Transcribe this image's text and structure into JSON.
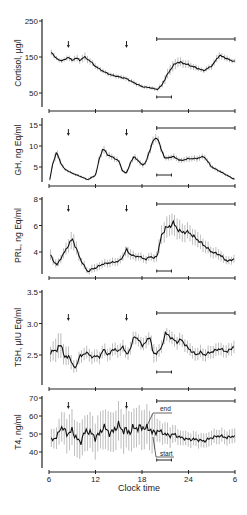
{
  "figure": {
    "xlabel": "Clock time",
    "x_ticks": [
      6,
      12,
      18,
      24,
      30
    ],
    "x_tick_labels": [
      "6",
      "12",
      "18",
      "24",
      "6"
    ]
  },
  "chart_data": [
    {
      "type": "line",
      "title": "",
      "ylabel": "Cortisol, µg/l",
      "y_ticks": [
        50,
        150,
        250
      ],
      "ylim": [
        30,
        250
      ],
      "xlim": [
        6,
        30
      ],
      "x": [
        6.3,
        7,
        7.5,
        8,
        8.5,
        9,
        9.5,
        10,
        10.5,
        11,
        11.5,
        12,
        13,
        14,
        15,
        16,
        17,
        18,
        18.5,
        19,
        19.5,
        20,
        20.5,
        21,
        21.5,
        22,
        22.5,
        23,
        24,
        25,
        26,
        27,
        27.5,
        28,
        28.5,
        29,
        29.5,
        30
      ],
      "values": [
        163,
        145,
        140,
        142,
        150,
        140,
        148,
        140,
        150,
        144,
        135,
        124,
        110,
        100,
        95,
        90,
        78,
        68,
        66,
        65,
        62,
        60,
        70,
        90,
        110,
        125,
        135,
        135,
        128,
        120,
        112,
        125,
        140,
        155,
        150,
        145,
        140,
        138
      ],
      "error": [
        8,
        6,
        6,
        6,
        8,
        6,
        10,
        8,
        12,
        10,
        8,
        8,
        6,
        6,
        6,
        6,
        6,
        5,
        5,
        5,
        5,
        5,
        8,
        12,
        14,
        14,
        14,
        12,
        10,
        8,
        6,
        8,
        10,
        10,
        8,
        8,
        6,
        6
      ],
      "arrows_x": [
        8.5,
        16
      ],
      "sleep_bar": [
        19.9,
        30
      ],
      "short_bar": [
        19.9,
        21.8
      ]
    },
    {
      "type": "line",
      "ylabel": "GH, ng Eq/ml",
      "y_ticks": [
        5,
        10,
        15
      ],
      "ylim": [
        0,
        16
      ],
      "xlim": [
        6,
        30
      ],
      "x": [
        6.1,
        6.5,
        7,
        7.5,
        8,
        8.5,
        9,
        10,
        11,
        12,
        12.5,
        13,
        13.5,
        14,
        15,
        15.5,
        16,
        16.5,
        17,
        17.5,
        18,
        18.5,
        19,
        19.5,
        20,
        20.5,
        21,
        22,
        23,
        24,
        25,
        26,
        27,
        28,
        29,
        30
      ],
      "values": [
        2,
        6,
        8.5,
        6,
        4.5,
        4,
        3.5,
        2.8,
        2,
        3,
        7,
        9.5,
        8,
        7.5,
        6.5,
        4,
        3.5,
        6,
        7.5,
        6.5,
        5.5,
        6,
        9,
        11.5,
        12,
        9,
        7,
        7.5,
        6.5,
        7,
        7,
        7.5,
        5,
        4,
        3,
        2
      ],
      "error": [
        0.3,
        0.8,
        1,
        0.6,
        0.4,
        0.3,
        0.3,
        0.3,
        0.3,
        0.4,
        0.8,
        1,
        0.8,
        0.8,
        0.6,
        0.4,
        0.4,
        0.6,
        0.8,
        0.6,
        0.6,
        0.7,
        1,
        1,
        1,
        0.8,
        0.6,
        0.7,
        0.6,
        0.7,
        0.7,
        0.7,
        0.5,
        0.4,
        0.3,
        0.3
      ],
      "arrows_x": [
        8.5,
        16
      ],
      "sleep_bar": [
        19.9,
        30
      ],
      "short_bar": [
        19.9,
        21.8
      ]
    },
    {
      "type": "line",
      "ylabel": "PRL, ng Eq/ml",
      "y_ticks": [
        4,
        6,
        8
      ],
      "ylim": [
        2,
        8
      ],
      "xlim": [
        6,
        30
      ],
      "x": [
        6.2,
        6.5,
        7,
        7.5,
        8,
        8.5,
        9,
        9.5,
        10,
        10.5,
        11,
        11.5,
        12,
        13,
        14,
        15,
        15.5,
        16,
        16.5,
        17,
        18,
        18.5,
        19,
        19.5,
        20,
        20.5,
        21,
        21.5,
        22,
        22.5,
        23,
        24,
        25,
        26,
        27,
        28,
        29,
        30
      ],
      "values": [
        3.8,
        3.4,
        3,
        3.5,
        4,
        4.5,
        5,
        4.3,
        3.5,
        3,
        2.5,
        2.7,
        2.8,
        3.1,
        3.2,
        3.3,
        3.6,
        4.2,
        3.8,
        3.7,
        3.6,
        3.4,
        3.7,
        3.5,
        3.8,
        5.2,
        5.8,
        5.9,
        6.2,
        5.8,
        5.5,
        5.5,
        5,
        4.5,
        4,
        3.8,
        3.3,
        3.5
      ],
      "error": [
        0.4,
        0.3,
        0.3,
        0.3,
        0.4,
        0.5,
        0.7,
        0.5,
        0.3,
        0.3,
        0.2,
        0.3,
        0.3,
        0.3,
        0.3,
        0.3,
        0.3,
        0.4,
        0.4,
        0.3,
        0.3,
        0.3,
        0.3,
        0.3,
        0.4,
        0.7,
        0.8,
        0.8,
        0.8,
        0.8,
        0.7,
        0.6,
        0.6,
        0.5,
        0.4,
        0.4,
        0.3,
        0.3
      ],
      "arrows_x": [
        8.5,
        16
      ],
      "sleep_bar": [
        19.9,
        30
      ],
      "short_bar": [
        19.9,
        21.8
      ]
    },
    {
      "type": "line",
      "ylabel": "TSH, µIU Eq/ml",
      "y_ticks": [
        2.5,
        3.0,
        3.5
      ],
      "ylim": [
        2.08,
        3.5
      ],
      "xlim": [
        6,
        30
      ],
      "x": [
        6.2,
        6.5,
        7,
        7.5,
        8,
        8.5,
        9,
        9.5,
        10,
        10.5,
        11,
        11.5,
        12,
        12.5,
        13,
        13.5,
        14,
        14.5,
        15,
        15.5,
        16,
        16.5,
        17,
        17.5,
        18,
        18.5,
        19,
        19.5,
        20,
        20.5,
        21,
        22,
        22.5,
        23,
        24,
        25,
        25.5,
        26,
        27,
        28,
        29,
        30
      ],
      "values": [
        2.5,
        2.6,
        2.55,
        2.7,
        2.45,
        2.5,
        2.35,
        2.3,
        2.5,
        2.5,
        2.55,
        2.45,
        2.5,
        2.45,
        2.6,
        2.5,
        2.55,
        2.6,
        2.55,
        2.65,
        2.5,
        2.6,
        2.8,
        2.75,
        2.65,
        2.7,
        2.8,
        2.5,
        2.55,
        2.6,
        2.85,
        2.75,
        2.7,
        2.75,
        2.6,
        2.5,
        2.55,
        2.5,
        2.55,
        2.6,
        2.55,
        2.65
      ],
      "error": [
        0.12,
        0.15,
        0.2,
        0.2,
        0.15,
        0.15,
        0.1,
        0.1,
        0.1,
        0.1,
        0.1,
        0.1,
        0.1,
        0.1,
        0.1,
        0.1,
        0.1,
        0.1,
        0.1,
        0.1,
        0.1,
        0.1,
        0.1,
        0.1,
        0.1,
        0.1,
        0.1,
        0.15,
        0.1,
        0.1,
        0.1,
        0.1,
        0.1,
        0.1,
        0.1,
        0.1,
        0.1,
        0.1,
        0.1,
        0.1,
        0.1,
        0.1
      ],
      "arrows_x": [
        8.5,
        16
      ],
      "sleep_bar": [
        19.9,
        30
      ],
      "short_bar": [
        19.9,
        21.8
      ]
    },
    {
      "type": "line",
      "ylabel": "T4, ng/ml",
      "y_ticks": [
        40,
        50,
        60,
        70
      ],
      "ylim": [
        30,
        70
      ],
      "xlim": [
        6,
        30
      ],
      "x": [
        6.3,
        7,
        7.5,
        8,
        8.5,
        9,
        9.5,
        10,
        10.5,
        11,
        11.5,
        12,
        12.5,
        13,
        13.5,
        14,
        14.5,
        15,
        15.5,
        16,
        16.5,
        17,
        17.5,
        18,
        18.5,
        19,
        19.5,
        20,
        20.5,
        21,
        21.5,
        22,
        23,
        24,
        25,
        26,
        27,
        28,
        29,
        30
      ],
      "values": [
        47,
        48,
        54,
        52,
        50,
        52,
        48,
        45,
        50,
        52,
        50,
        48,
        50,
        54,
        52,
        50,
        53,
        55,
        52,
        52,
        51,
        54,
        53,
        54,
        53,
        53,
        50,
        52,
        51,
        50,
        49,
        50,
        48,
        47,
        47,
        46,
        48,
        49,
        48,
        49
      ],
      "error": [
        5,
        6,
        8,
        9,
        10,
        10,
        10,
        10,
        10,
        10,
        10,
        10,
        10,
        11,
        11,
        11,
        11,
        11,
        11,
        11,
        11,
        11,
        11,
        11,
        11,
        11,
        11,
        6,
        6,
        6,
        6,
        5,
        4,
        4,
        4,
        4,
        4,
        4,
        4,
        4
      ],
      "arrows_x": [
        8.5,
        16
      ],
      "sleep_bar": [
        19.9,
        30
      ],
      "short_bar": [
        19.9,
        21.8
      ],
      "annotations": [
        "end",
        "start"
      ]
    }
  ]
}
